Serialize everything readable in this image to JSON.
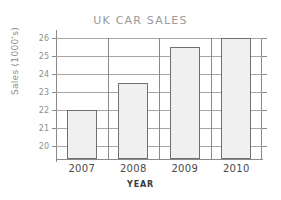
{
  "chart_data": {
    "type": "bar",
    "title": "UK CAR SALES",
    "xlabel": "YEAR",
    "ylabel": "Sales (1000's)",
    "categories": [
      "2007",
      "2008",
      "2009",
      "2010"
    ],
    "values": [
      22,
      23.5,
      25.5,
      26
    ],
    "ytick_labels": [
      "20",
      "21",
      "22",
      "23",
      "24",
      "25",
      "26"
    ],
    "ytick_values": [
      20,
      21,
      22,
      23,
      24,
      25,
      26
    ],
    "ylim": [
      19.3,
      26
    ],
    "grid": true,
    "legend": null,
    "series": [
      {
        "name": "Sales",
        "values": [
          22,
          23.5,
          25.5,
          26
        ]
      }
    ],
    "colors": {
      "bar_fill": "#f0f0f0",
      "bar_border": "#707070",
      "gridline": "#a6a6a6",
      "axis": "#8a8a8a",
      "title_text": "#9a9a9a",
      "tick_text": "#8e8e8e",
      "xlabel_text": "#4a4a4a",
      "background": "#ffffff"
    }
  }
}
